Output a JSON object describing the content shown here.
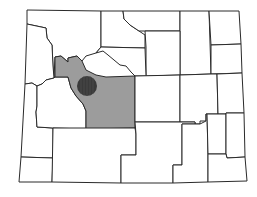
{
  "map": {
    "region": "Wyoming counties",
    "highlighted_county": "Fremont",
    "colors": {
      "background": "#ffffff",
      "county_fill": "#ffffff",
      "highlight_fill": "#9c9c9c",
      "border": "#2a2a2a",
      "marker": "#3a3a3a"
    },
    "marker": {
      "shape": "circle",
      "cx": 87,
      "cy": 86,
      "r": 10
    }
  }
}
